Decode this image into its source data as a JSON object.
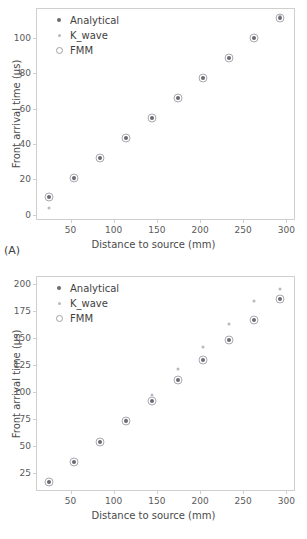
{
  "figure": {
    "panels": [
      {
        "id": "A",
        "label": "(A)",
        "legend": [
          {
            "name": "Analytical",
            "marker": "filled-dot-dark",
            "color": "#6b6b72"
          },
          {
            "name": "K_wave",
            "marker": "filled-dot-light",
            "color": "#b9b9c0"
          },
          {
            "name": "FMM",
            "marker": "open-circle",
            "color": "#a8a8b0"
          }
        ],
        "chart_data": {
          "type": "scatter",
          "title": "",
          "xlabel": "Distance to source (mm)",
          "ylabel": "Front arrival time (µs)",
          "xlim": [
            10,
            310
          ],
          "ylim": [
            -3,
            117
          ],
          "xticks": [
            50,
            100,
            150,
            200,
            250,
            300
          ],
          "yticks": [
            0,
            20,
            40,
            60,
            80,
            100
          ],
          "grid": false,
          "legend_position": "upper-left",
          "x": [
            25,
            54,
            84,
            114,
            144,
            174,
            204,
            233,
            263,
            293
          ],
          "series": [
            {
              "name": "Analytical",
              "values": [
                9.8,
                20.6,
                32.2,
                43.5,
                54.8,
                66.1,
                77.4,
                88.8,
                100.2,
                111.6
              ]
            },
            {
              "name": "K_wave",
              "values": [
                4.0,
                20.2,
                32.0,
                43.3,
                54.6,
                66.0,
                77.3,
                88.7,
                100.1,
                112.5
              ]
            },
            {
              "name": "FMM",
              "values": [
                9.8,
                20.6,
                32.2,
                43.5,
                54.8,
                66.1,
                77.4,
                88.8,
                100.2,
                111.6
              ]
            }
          ]
        }
      },
      {
        "id": "B",
        "label": "(B)",
        "legend": [
          {
            "name": "Analytical",
            "marker": "filled-dot-dark",
            "color": "#6b6b72"
          },
          {
            "name": "K_wave",
            "marker": "filled-dot-light",
            "color": "#b9b9c0"
          },
          {
            "name": "FMM",
            "marker": "open-circle",
            "color": "#a8a8b0"
          }
        ],
        "chart_data": {
          "type": "scatter",
          "title": "",
          "xlabel": "Distance to source (mm)",
          "ylabel": "Front arrival time (µs)",
          "xlim": [
            10,
            310
          ],
          "ylim": [
            8,
            207
          ],
          "xticks": [
            50,
            100,
            150,
            200,
            250,
            300
          ],
          "yticks": [
            25,
            50,
            75,
            100,
            125,
            150,
            175,
            200
          ],
          "grid": false,
          "legend_position": "upper-left",
          "x": [
            25,
            54,
            84,
            114,
            144,
            174,
            204,
            233,
            263,
            293
          ],
          "series": [
            {
              "name": "Analytical",
              "values": [
                16.0,
                35.0,
                53.5,
                73.0,
                91.5,
                110.5,
                129.0,
                147.5,
                166.5,
                185.5
              ]
            },
            {
              "name": "K_wave",
              "values": [
                16.5,
                35.2,
                53.8,
                73.5,
                96.5,
                120.5,
                141.0,
                162.5,
                183.5,
                195.0
              ]
            },
            {
              "name": "FMM",
              "values": [
                16.0,
                35.0,
                53.5,
                73.0,
                91.5,
                110.5,
                129.0,
                147.5,
                166.5,
                185.5
              ]
            }
          ]
        }
      }
    ]
  }
}
